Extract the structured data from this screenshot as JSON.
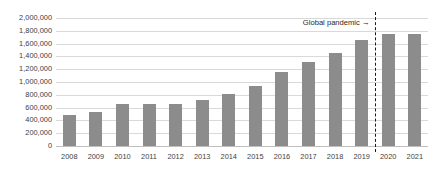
{
  "title_strip": "",
  "chart_data": {
    "type": "bar",
    "title": "",
    "xlabel": "",
    "ylabel": "",
    "categories": [
      "2008",
      "2009",
      "2010",
      "2011",
      "2012",
      "2013",
      "2014",
      "2015",
      "2016",
      "2017",
      "2018",
      "2019",
      "2020",
      "2021"
    ],
    "values": [
      485000,
      535000,
      650000,
      650000,
      650000,
      720000,
      810000,
      940000,
      1150000,
      1320000,
      1450000,
      1650000,
      1750000,
      1750000
    ],
    "ylim": [
      0,
      2000000
    ],
    "ytick_step": 200000,
    "ytick_labels": [
      "2,000,000",
      "1,800,000",
      "1,600,000",
      "1,400,000",
      "1,200,000",
      "1,000,000",
      "800,000",
      "600,000",
      "400,000",
      "200,000",
      "0"
    ],
    "ytick_values": [
      2000000,
      1800000,
      1600000,
      1400000,
      1200000,
      1000000,
      800000,
      600000,
      400000,
      200000,
      0
    ],
    "grid": true,
    "legend": false,
    "bar_color": "#8c8c8c",
    "grid_color": "#d9d9d9",
    "annotations": [
      {
        "name": "global-pandemic",
        "text": "Global pandemic →",
        "marker": "dashed-vertical-line",
        "between": [
          "2019",
          "2020"
        ],
        "color": "#1a1a1a"
      }
    ]
  }
}
